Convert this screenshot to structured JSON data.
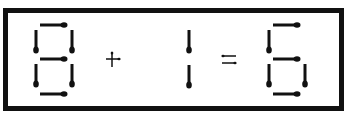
{
  "puzzle": {
    "type": "matchstick-equation",
    "equation_text": "8 + 1 = 6",
    "tokens": [
      {
        "kind": "digit",
        "value": "8",
        "segments": [
          "a",
          "b",
          "c",
          "d",
          "e",
          "f",
          "g"
        ]
      },
      {
        "kind": "operator",
        "value": "+"
      },
      {
        "kind": "digit",
        "value": "1",
        "segments": [
          "b",
          "c"
        ]
      },
      {
        "kind": "operator",
        "value": "="
      },
      {
        "kind": "digit",
        "value": "6",
        "segments": [
          "a",
          "c",
          "d",
          "e",
          "f",
          "g"
        ]
      }
    ],
    "colors": {
      "stick": "#111111",
      "frame": "#111111",
      "background": "#ffffff"
    }
  }
}
